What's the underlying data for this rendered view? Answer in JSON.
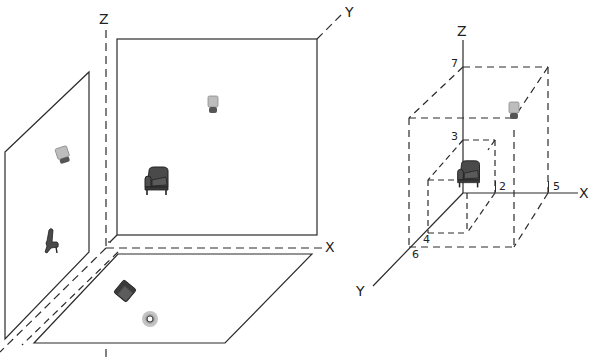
{
  "colors": {
    "line": "#2b2b2b",
    "object_dark": "#4a4a4a",
    "object_light": "#b8b8b8",
    "lamp_shade": "#bdbdbd",
    "lamp_base": "#555555",
    "marker_ring": "#c4c4c4",
    "background": "#ffffff"
  },
  "left_diagram": {
    "title": "Orthographic projections onto coordinate planes",
    "axes": {
      "x_label": "X",
      "y_label": "Y",
      "z_label": "Z"
    },
    "planes": [
      {
        "name": "XZ-plane (front view)",
        "objects": [
          "lamp",
          "armchair"
        ]
      },
      {
        "name": "YZ-plane (side view)",
        "objects": [
          "lamp",
          "chair-side"
        ]
      },
      {
        "name": "XY-plane (top view)",
        "objects": [
          "armchair-top",
          "lamp-top"
        ]
      }
    ]
  },
  "right_diagram": {
    "title": "3D coordinate placement",
    "axes": {
      "x_label": "X",
      "y_label": "Y",
      "z_label": "Z"
    },
    "ticks": {
      "z": [
        "7",
        "3"
      ],
      "x": [
        "2",
        "5"
      ],
      "y": [
        "4",
        "6"
      ]
    },
    "objects": [
      {
        "name": "armchair",
        "x": 0,
        "y": 0,
        "z": 0,
        "box": {
          "x": 2,
          "y": 4,
          "z": 3
        }
      },
      {
        "name": "lamp",
        "x": 5,
        "y": 6,
        "z": 7,
        "box": {
          "x": 5,
          "y": 6,
          "z": 7
        }
      }
    ]
  }
}
